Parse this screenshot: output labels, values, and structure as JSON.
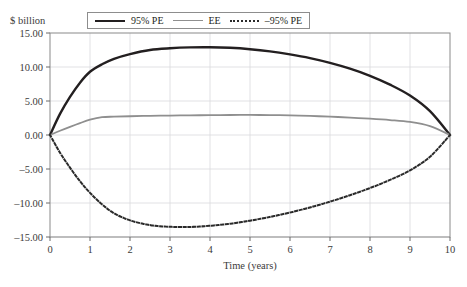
{
  "figure": {
    "top_caption": "",
    "y_unit_label": "$ billion"
  },
  "legend": {
    "items": [
      {
        "label": "95% PE",
        "style": "solid-thick-black",
        "color": "#231f20"
      },
      {
        "label": "EE",
        "style": "solid-gray",
        "color": "#8f8f8f"
      },
      {
        "label": "–95% PE",
        "style": "dotted-black",
        "color": "#2a2a2a"
      }
    ]
  },
  "chart_data": {
    "type": "line",
    "title": "",
    "xlabel": "Time (years)",
    "ylabel": "$ billion",
    "xlim": [
      0,
      10
    ],
    "ylim": [
      -15,
      15
    ],
    "grid": true,
    "legend_position": "top",
    "xticks": [
      "0",
      "1",
      "2",
      "3",
      "4",
      "5",
      "6",
      "7",
      "8",
      "9",
      "10"
    ],
    "xtick_values": [
      0,
      1,
      2,
      3,
      4,
      5,
      6,
      7,
      8,
      9,
      10
    ],
    "yticks": [
      "15.00",
      "10.00",
      "5.00",
      "0.00",
      "–5.00",
      "–10.00",
      "–15.00"
    ],
    "ytick_values": [
      15,
      10,
      5,
      0,
      -5,
      -10,
      -15
    ],
    "x": [
      0,
      0.25,
      0.5,
      0.75,
      1,
      1.3,
      1.6,
      2,
      2.5,
      3,
      3.5,
      4,
      4.5,
      5,
      5.5,
      6,
      6.5,
      7,
      7.5,
      8,
      8.5,
      9,
      9.5,
      10
    ],
    "series": [
      {
        "name": "95% PE",
        "color": "#231f20",
        "style": "solid",
        "width": 2.4,
        "values": [
          0.0,
          3.1,
          5.6,
          7.7,
          9.3,
          10.4,
          11.2,
          11.9,
          12.5,
          12.75,
          12.88,
          12.9,
          12.82,
          12.62,
          12.3,
          11.85,
          11.3,
          10.6,
          9.75,
          8.7,
          7.4,
          5.8,
          3.5,
          0.0
        ]
      },
      {
        "name": "EE",
        "color": "#8f8f8f",
        "style": "solid",
        "width": 1.8,
        "values": [
          0.0,
          0.62,
          1.2,
          1.75,
          2.25,
          2.62,
          2.7,
          2.76,
          2.82,
          2.86,
          2.89,
          2.92,
          2.94,
          2.95,
          2.93,
          2.88,
          2.8,
          2.7,
          2.56,
          2.4,
          2.2,
          1.92,
          1.3,
          0.0
        ]
      },
      {
        "name": "–95% PE",
        "color": "#2a2a2a",
        "style": "dotted",
        "width": 2.0,
        "values": [
          0.0,
          -2.6,
          -4.8,
          -6.8,
          -8.5,
          -10.2,
          -11.5,
          -12.55,
          -13.25,
          -13.5,
          -13.52,
          -13.35,
          -13.05,
          -12.6,
          -12.05,
          -11.4,
          -10.65,
          -9.8,
          -8.85,
          -7.8,
          -6.6,
          -5.2,
          -3.2,
          0.0
        ]
      }
    ]
  },
  "geometry": {
    "plot_left": 50,
    "plot_right": 450,
    "plot_top": 33,
    "plot_bottom": 237
  }
}
